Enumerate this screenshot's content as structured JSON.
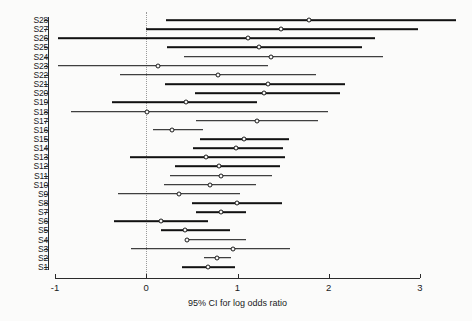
{
  "chart_data": {
    "type": "forest",
    "title": "",
    "xlabel": "95% CI for log odds ratio",
    "ylabel": "",
    "xlim": [
      -1,
      3
    ],
    "xticks": [
      -1,
      0,
      1,
      2,
      3
    ],
    "xtick_labels": [
      "-1",
      "0",
      "1",
      "2",
      "3"
    ],
    "grid": false,
    "legend": "none",
    "reference_line": {
      "value": 0,
      "style": "dotted"
    },
    "marker": "open-circle",
    "categories": [
      "S28",
      "S27",
      "S26",
      "S25",
      "S24",
      "S23",
      "S22",
      "S21",
      "S20",
      "S19",
      "S18",
      "S17",
      "S16",
      "S15",
      "S14",
      "S13",
      "S12",
      "S11",
      "S10",
      "S9",
      "S8",
      "S7",
      "S6",
      "S5",
      "S4",
      "S3",
      "S2",
      "S1"
    ],
    "estimates": [
      1.78,
      1.48,
      1.11,
      1.24,
      1.37,
      0.13,
      0.79,
      1.33,
      1.29,
      0.44,
      0.01,
      1.21,
      0.28,
      1.07,
      0.98,
      0.66,
      0.8,
      0.82,
      0.7,
      0.36,
      0.99,
      0.82,
      0.16,
      0.42,
      0.45,
      0.95,
      0.78,
      0.68
    ],
    "ci_lower": [
      0.22,
      0.0,
      -0.97,
      0.23,
      0.41,
      -0.97,
      -0.29,
      0.21,
      0.53,
      -0.38,
      -0.82,
      0.55,
      0.07,
      0.59,
      0.51,
      -0.18,
      0.32,
      0.26,
      0.19,
      -0.31,
      0.5,
      0.55,
      -0.35,
      0.16,
      0.52,
      -0.17,
      0.63,
      0.39
    ],
    "ci_upper": [
      3.4,
      2.98,
      2.51,
      2.36,
      2.6,
      1.33,
      1.86,
      2.18,
      2.12,
      1.21,
      1.99,
      1.88,
      0.62,
      1.56,
      1.5,
      1.52,
      1.47,
      1.38,
      1.2,
      1.03,
      1.49,
      1.09,
      0.68,
      0.92,
      1.09,
      1.57,
      0.93,
      0.97
    ],
    "series": [
      {
        "label": "S28",
        "estimate": 1.78,
        "lower": 0.22,
        "upper": 3.4
      },
      {
        "label": "S27",
        "estimate": 1.48,
        "lower": 0.0,
        "upper": 2.98
      },
      {
        "label": "S26",
        "estimate": 1.11,
        "lower": -0.97,
        "upper": 2.51
      },
      {
        "label": "S25",
        "estimate": 1.24,
        "lower": 0.23,
        "upper": 2.36
      },
      {
        "label": "S24",
        "estimate": 1.37,
        "lower": 0.41,
        "upper": 2.6
      },
      {
        "label": "S23",
        "estimate": 0.13,
        "lower": -0.97,
        "upper": 1.33
      },
      {
        "label": "S22",
        "estimate": 0.79,
        "lower": -0.29,
        "upper": 1.86
      },
      {
        "label": "S21",
        "estimate": 1.33,
        "lower": 0.21,
        "upper": 2.18
      },
      {
        "label": "S20",
        "estimate": 1.29,
        "lower": 0.53,
        "upper": 2.12
      },
      {
        "label": "S19",
        "estimate": 0.44,
        "lower": -0.38,
        "upper": 1.21
      },
      {
        "label": "S18",
        "estimate": 0.01,
        "lower": -0.82,
        "upper": 1.99
      },
      {
        "label": "S17",
        "estimate": 1.21,
        "lower": 0.55,
        "upper": 1.88
      },
      {
        "label": "S16",
        "estimate": 0.28,
        "lower": 0.07,
        "upper": 0.62
      },
      {
        "label": "S15",
        "estimate": 1.07,
        "lower": 0.59,
        "upper": 1.56
      },
      {
        "label": "S14",
        "estimate": 0.98,
        "lower": 0.51,
        "upper": 1.5
      },
      {
        "label": "S13",
        "estimate": 0.66,
        "lower": -0.18,
        "upper": 1.52
      },
      {
        "label": "S12",
        "estimate": 0.8,
        "lower": 0.32,
        "upper": 1.47
      },
      {
        "label": "S11",
        "estimate": 0.82,
        "lower": 0.26,
        "upper": 1.38
      },
      {
        "label": "S10",
        "estimate": 0.7,
        "lower": 0.19,
        "upper": 1.2
      },
      {
        "label": "S9",
        "estimate": 0.36,
        "lower": -0.31,
        "upper": 1.03
      },
      {
        "label": "S8",
        "estimate": 0.99,
        "lower": 0.5,
        "upper": 1.49
      },
      {
        "label": "S7",
        "estimate": 0.82,
        "lower": 0.55,
        "upper": 1.09
      },
      {
        "label": "S6",
        "estimate": 0.16,
        "lower": -0.35,
        "upper": 0.68
      },
      {
        "label": "S5",
        "estimate": 0.42,
        "lower": 0.16,
        "upper": 0.92
      },
      {
        "label": "S4",
        "estimate": 0.45,
        "lower": 0.52,
        "upper": 1.09
      },
      {
        "label": "S3",
        "estimate": 0.95,
        "lower": -0.17,
        "upper": 1.57
      },
      {
        "label": "S2",
        "estimate": 0.78,
        "lower": 0.63,
        "upper": 0.93
      },
      {
        "label": "S1",
        "estimate": 0.68,
        "lower": 0.39,
        "upper": 0.97
      }
    ]
  },
  "colors": {
    "axis": "#2b2b2b",
    "line": "#111111",
    "marker_fill": "#f7f7f6",
    "reference": "#9a9a9a",
    "background": "#fbfbfa"
  }
}
